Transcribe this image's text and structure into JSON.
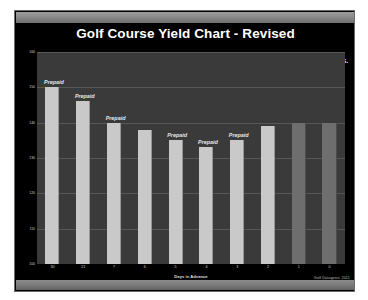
{
  "slide": {
    "title": "Golf Course Yield Chart - Revised",
    "watermark": "Golf Datagenic 2011",
    "annotation": "40% of times booked in last 48 hrs.",
    "arrow_icon": "down-right-arrow-icon",
    "accent_light": "#c9c9c9",
    "accent_dark": "#6e6e6e",
    "plot_bg": "#3a3a3a",
    "slide_bg": "#000000"
  },
  "chart_data": {
    "type": "bar",
    "title": "Golf Course Yield Chart - Revised",
    "xlabel": "Days in Advance",
    "ylabel": "",
    "categories": [
      "30",
      "21",
      "7",
      "6",
      "5",
      "4",
      "3",
      "2",
      "1",
      "0"
    ],
    "values": [
      150,
      146,
      140,
      138,
      135,
      133,
      135,
      139,
      140,
      140
    ],
    "bar_styles": [
      "light",
      "light",
      "light",
      "light",
      "light",
      "light",
      "light",
      "light",
      "dark",
      "dark"
    ],
    "point_labels": [
      "Prepaid",
      "Prepaid",
      "Prepaid",
      "",
      "Prepaid",
      "Prepaid",
      "Prepaid",
      "",
      "",
      ""
    ],
    "ylim": [
      100,
      160
    ],
    "yticks": [
      160,
      150,
      140,
      130,
      120,
      110,
      100
    ],
    "ytick_labels": [
      "160",
      "150",
      "140",
      "130",
      "120",
      "110",
      "100"
    ],
    "grid": true,
    "legend": false,
    "annotations": [
      "40% of times booked in last 48 hrs."
    ]
  }
}
